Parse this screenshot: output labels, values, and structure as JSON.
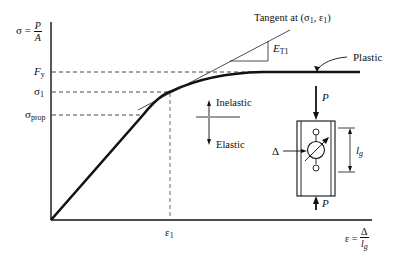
{
  "diagram": {
    "type": "stress-strain curve",
    "y_axis": {
      "label_lhs": "σ =",
      "label_num": "P",
      "label_den": "A"
    },
    "x_axis": {
      "label_lhs": "ε =",
      "label_num": "Δ",
      "label_den_main": "l",
      "label_den_sub": "g"
    },
    "y_ticks": [
      {
        "main": "F",
        "sub": "y"
      },
      {
        "main": "σ",
        "sub": "1"
      },
      {
        "main": "σ",
        "sub": "prop"
      }
    ],
    "x_ticks": [
      {
        "main": "ε",
        "sub": "1"
      }
    ],
    "annotations": {
      "tangent": "Tangent at (σ",
      "tangent_sub1": "1",
      "tangent_mid": ", ε",
      "tangent_sub2": "1",
      "tangent_end": ")",
      "slope_main": "E",
      "slope_sub": "T1",
      "plastic": "Plastic",
      "inelastic": "Inelastic",
      "elastic": "Elastic",
      "load_top": "P",
      "load_bottom": "P",
      "delta": "Δ",
      "gauge_main": "l",
      "gauge_sub": "g"
    },
    "colors": {
      "line": "#111111",
      "background": "#ffffff"
    }
  }
}
